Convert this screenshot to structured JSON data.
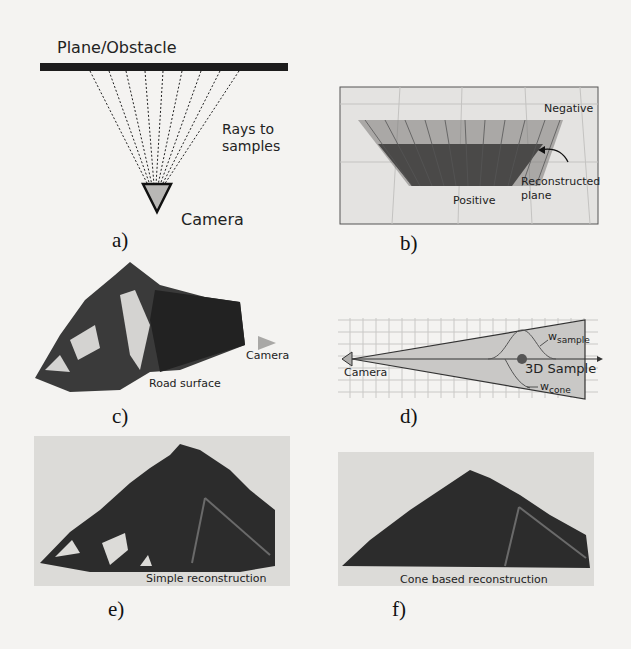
{
  "figure": {
    "panels": [
      {
        "id": "a",
        "caption": "a)",
        "labels": {
          "obstacle": "Plane/Obstacle",
          "rays_line1": "Rays to",
          "rays_line2": "samples",
          "camera": "Camera"
        }
      },
      {
        "id": "b",
        "caption": "b)",
        "labels": {
          "negative": "Negative",
          "reconstructed_line1": "Reconstructed",
          "reconstructed_line2": "plane",
          "positive": "Positive"
        }
      },
      {
        "id": "c",
        "caption": "c)",
        "labels": {
          "camera": "Camera",
          "road": "Road surface"
        }
      },
      {
        "id": "d",
        "caption": "d)",
        "labels": {
          "camera": "Camera",
          "sample": "3D Sample",
          "w_sample": "w",
          "w_sample_sub": "sample",
          "w_cone": "w",
          "w_cone_sub": "cone"
        }
      },
      {
        "id": "e",
        "caption": "e)",
        "labels": {
          "title": "Simple reconstruction"
        }
      },
      {
        "id": "f",
        "caption": "f)",
        "labels": {
          "title": "Cone based reconstruction"
        }
      }
    ]
  },
  "colors": {
    "background": "#f4f3f1",
    "ink": "#1a1a1a",
    "panel_gray": "#dcdbd8",
    "surface_dark": "#2c2c2c",
    "cone_fill": "#c9c8c6",
    "camera_marker": "#a9a8a6"
  }
}
